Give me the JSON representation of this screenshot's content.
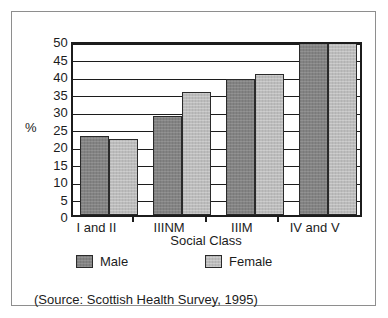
{
  "chart_data": {
    "type": "bar",
    "title": "",
    "categories": [
      "I and II",
      "IIINM",
      "IIIM",
      "IV and V"
    ],
    "series": [
      {
        "name": "Male",
        "values": [
          22.7,
          28.3,
          39.0,
          49.2
        ],
        "color": "#838383"
      },
      {
        "name": "Female",
        "values": [
          21.7,
          35.2,
          40.3,
          49.2
        ],
        "color": "#bcbcbc"
      }
    ],
    "xlabel": "Social Class",
    "ylabel": "%",
    "ylim": [
      0,
      50
    ],
    "yticks": [
      0,
      5,
      10,
      15,
      20,
      25,
      30,
      35,
      40,
      45,
      50
    ],
    "ytick_labels": [
      "0",
      "5",
      "10",
      "15",
      "20",
      "25",
      "30",
      "35",
      "40",
      "45",
      "50"
    ],
    "grid": true,
    "grid_axis": "y",
    "legend_position": "bottom"
  },
  "legend": {
    "entries": [
      {
        "label": "Male",
        "swatch": "male-swatch"
      },
      {
        "label": "Female",
        "swatch": "female-swatch"
      }
    ]
  },
  "footer": {
    "source": "(Source: Scottish Health Survey, 1995)"
  }
}
